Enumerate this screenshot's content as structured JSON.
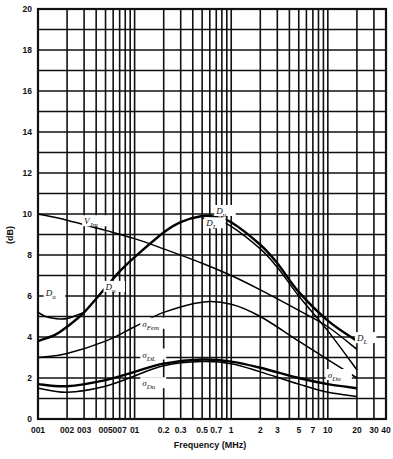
{
  "chart_data": {
    "type": "line",
    "title": "",
    "xlabel": "Frequency (MHz)",
    "ylabel": "(dB)",
    "xscale": "log",
    "xlim": [
      0.01,
      40
    ],
    "ylim": [
      0,
      20
    ],
    "grid": true,
    "x_tick_labels": [
      "001",
      "002",
      "003",
      "005",
      "007",
      "01",
      "0.2",
      "0.3",
      "0.5",
      "0.7",
      "1",
      "2",
      "3",
      "5",
      "7",
      "10",
      "20",
      "30",
      "40"
    ],
    "x_tick_values": [
      0.01,
      0.02,
      0.03,
      0.05,
      0.07,
      0.1,
      0.2,
      0.3,
      0.5,
      0.7,
      1,
      2,
      3,
      5,
      7,
      10,
      20,
      30,
      40
    ],
    "y_tick_labels": [
      "0",
      "2",
      "4",
      "6",
      "8",
      "10",
      "12",
      "14",
      "16",
      "18",
      "20"
    ],
    "y_tick_values": [
      0,
      2,
      4,
      6,
      8,
      10,
      12,
      14,
      16,
      18,
      20
    ],
    "series": [
      {
        "name": "V_Jm",
        "x": [
          0.01,
          0.02,
          0.05,
          0.1,
          0.2,
          0.5,
          1,
          2,
          5,
          10,
          20
        ],
        "values": [
          10.0,
          9.7,
          9.2,
          8.8,
          8.3,
          7.6,
          7.0,
          6.3,
          5.3,
          4.5,
          3.4
        ]
      },
      {
        "name": "D_u",
        "x": [
          0.01,
          0.015,
          0.02,
          0.03,
          0.05,
          0.07,
          0.1,
          0.2,
          0.3,
          0.5,
          0.7,
          1,
          2,
          3,
          5,
          10,
          20
        ],
        "values": [
          3.8,
          4.1,
          4.5,
          5.2,
          6.4,
          7.2,
          7.9,
          9.1,
          9.6,
          9.9,
          9.85,
          9.6,
          8.5,
          7.6,
          6.2,
          4.8,
          3.8
        ]
      },
      {
        "name": "D_L",
        "x": [
          0.5,
          0.7,
          1,
          2,
          3,
          5,
          10,
          20
        ],
        "values": [
          9.8,
          9.7,
          9.4,
          8.3,
          7.4,
          6.0,
          4.3,
          2.4
        ]
      },
      {
        "name": "D_u (low-freq)",
        "x": [
          0.01,
          0.012,
          0.015,
          0.02,
          0.03
        ],
        "values": [
          5.2,
          5.0,
          4.9,
          4.9,
          5.2
        ]
      },
      {
        "name": "σ_Fem",
        "x": [
          0.01,
          0.02,
          0.05,
          0.1,
          0.2,
          0.5,
          1,
          2,
          5,
          10,
          20
        ],
        "values": [
          3.0,
          3.2,
          3.8,
          4.5,
          5.2,
          5.7,
          5.6,
          5.0,
          3.8,
          2.9,
          2.0
        ]
      },
      {
        "name": "σ_DL",
        "x": [
          0.01,
          0.02,
          0.05,
          0.1,
          0.2,
          0.5,
          1,
          2,
          5,
          10,
          20
        ],
        "values": [
          1.7,
          1.6,
          1.9,
          2.3,
          2.7,
          2.9,
          2.8,
          2.5,
          2.0,
          1.7,
          1.5
        ]
      },
      {
        "name": "σ_Du",
        "x": [
          0.01,
          0.02,
          0.05,
          0.1,
          0.2,
          0.5,
          1,
          2,
          5,
          10,
          20
        ],
        "values": [
          1.5,
          1.3,
          1.6,
          2.1,
          2.6,
          2.8,
          2.7,
          2.3,
          1.7,
          1.3,
          1.1
        ]
      }
    ],
    "annotations": [
      {
        "text": "V_Jm",
        "near": [
          0.03,
          9.5
        ]
      },
      {
        "text": "D_u",
        "near": [
          0.7,
          10.0
        ]
      },
      {
        "text": "D_L",
        "near": [
          0.55,
          9.4
        ]
      },
      {
        "text": "D_u",
        "near": [
          0.012,
          6.0
        ]
      },
      {
        "text": "D_u",
        "near": [
          0.05,
          6.3
        ]
      },
      {
        "text": "σ_Fem",
        "near": [
          0.12,
          4.5
        ]
      },
      {
        "text": "σ_DL",
        "near": [
          0.12,
          3.0
        ]
      },
      {
        "text": "σ_Du",
        "near": [
          0.12,
          1.6
        ]
      },
      {
        "text": "D_L",
        "near": [
          20,
          3.8
        ]
      },
      {
        "text": "σ_Du",
        "near": [
          10,
          2.0
        ]
      }
    ]
  },
  "labels": {
    "xlabel": "Frequency (MHz)",
    "ylabel": "(dB)"
  }
}
